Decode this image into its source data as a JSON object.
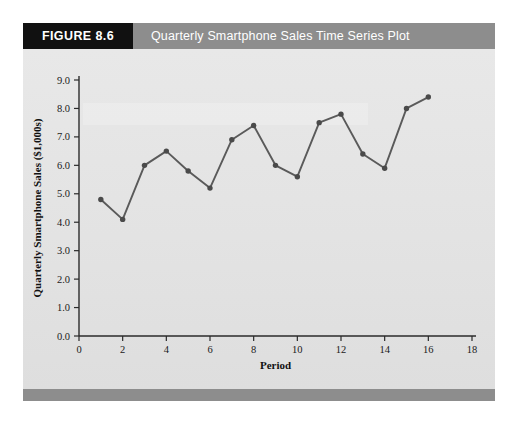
{
  "figure": {
    "tag": "FIGURE 8.6",
    "title": "Quarterly Smartphone Sales Time Series Plot"
  },
  "colors": {
    "tag_background": "#111111",
    "title_background": "#8d8d8d",
    "panel_background": "#e6e6e6",
    "footer_bar": "#8d8d8d",
    "series": "#5a5a5a",
    "marker": "#4a4a4a",
    "axis": "#2b2b2b"
  },
  "chart_data": {
    "type": "line",
    "title": "Quarterly Smartphone Sales Time Series Plot",
    "xlabel": "Period",
    "ylabel": "Quarterly Smartphone Sales ($1,000s)",
    "x": [
      1,
      2,
      3,
      4,
      5,
      6,
      7,
      8,
      9,
      10,
      11,
      12,
      13,
      14,
      15,
      16
    ],
    "values": [
      4.8,
      4.1,
      6.0,
      6.5,
      5.8,
      5.2,
      6.9,
      7.4,
      6.0,
      5.6,
      7.5,
      7.8,
      6.4,
      5.9,
      8.0,
      8.4
    ],
    "series": [
      {
        "name": "Quarterly Smartphone Sales",
        "values": [
          4.8,
          4.1,
          6.0,
          6.5,
          5.8,
          5.2,
          6.9,
          7.4,
          6.0,
          5.6,
          7.5,
          7.8,
          6.4,
          5.9,
          8.0,
          8.4
        ]
      }
    ],
    "xlim": [
      0,
      18
    ],
    "ylim": [
      0.0,
      9.0
    ],
    "xticks": [
      0,
      2,
      4,
      6,
      8,
      10,
      12,
      14,
      16,
      18
    ],
    "xtick_labels": [
      "0",
      "2",
      "4",
      "6",
      "8",
      "10",
      "12",
      "14",
      "16",
      "18"
    ],
    "yticks": [
      0.0,
      1.0,
      2.0,
      3.0,
      4.0,
      5.0,
      6.0,
      7.0,
      8.0,
      9.0
    ],
    "ytick_labels": [
      "0.0",
      "1.0",
      "2.0",
      "3.0",
      "4.0",
      "5.0",
      "6.0",
      "7.0",
      "8.0",
      "9.0"
    ],
    "grid": false,
    "legend": null,
    "markers": "filled-circle"
  }
}
